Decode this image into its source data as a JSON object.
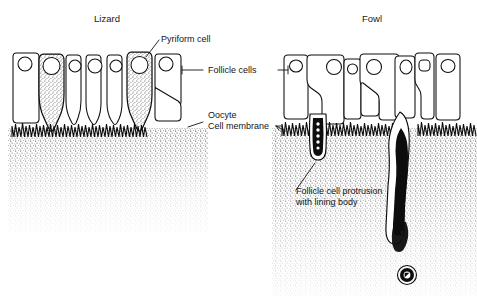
{
  "figure": {
    "kind": "biological-schematic",
    "background_color": "#ffffff",
    "ink_color": "#0d0d0d"
  },
  "panels": [
    {
      "id": "lizard",
      "title": "Lizard",
      "title_x": 107,
      "title_y": 22,
      "features": [
        "pyriform cells",
        "follicle cells",
        "microvilli",
        "oocyte cell membrane"
      ]
    },
    {
      "id": "fowl",
      "title": "Fowl",
      "title_x": 372,
      "title_y": 22,
      "features": [
        "follicle cells",
        "microvilli",
        "oocyte cell membrane",
        "follicle cell protrusion",
        "lining body"
      ]
    }
  ],
  "labels": [
    {
      "id": "pyriform-cell",
      "text": "Pyriform cell",
      "x": 161,
      "y": 42,
      "anchor": "start",
      "leader": "down-left to shaded pear-shaped cell"
    },
    {
      "id": "follicle-cells",
      "text": "Follicle cells",
      "x": 208,
      "y": 73,
      "anchor": "start",
      "leader": "horizontal both sides to epithelial cells"
    },
    {
      "id": "oocyte",
      "text": "Oocyte",
      "x": 208,
      "y": 118,
      "anchor": "start",
      "leader": "horizontal both sides to stippled oocyte"
    },
    {
      "id": "cell-membrane",
      "text": "Cell membrane",
      "x": 208,
      "y": 129,
      "anchor": "start",
      "leader": "shared with oocyte label"
    },
    {
      "id": "follicle-cell-protrusion",
      "text": "Follicle cell protrusion",
      "x": 296,
      "y": 194,
      "anchor": "start",
      "leader": "up-right to short protrusion"
    },
    {
      "id": "lining-body",
      "text": "with lining body",
      "x": 296,
      "y": 205,
      "anchor": "start",
      "leader": "second line of protrusion label"
    }
  ],
  "structures": {
    "lizard_cells": 7,
    "lizard_pyriform_cells": 2,
    "fowl_cells": 7,
    "fowl_protrusions": 2,
    "free_lining_body": 1
  }
}
